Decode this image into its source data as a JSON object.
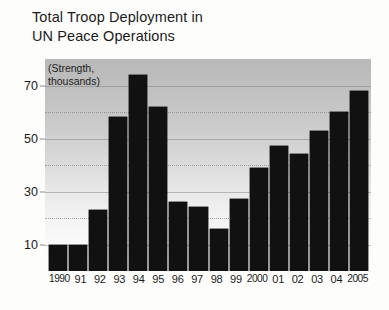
{
  "title": {
    "line1": "Total Troop Deployment in",
    "line2": "UN Peace Operations"
  },
  "axis_note": {
    "line1": "(Strength,",
    "line2": "thousands)"
  },
  "colors": {
    "bar": "#111111",
    "plot_background_top": "#b9b9b9",
    "plot_background_bottom": "#fefefe",
    "gridline": "#787878",
    "text": "#1b1b1b",
    "page_background": "#fdfdfc"
  },
  "chart_data": {
    "type": "bar",
    "title": "Total Troop Deployment in UN Peace Operations",
    "subtitle": "(Strength, thousands)",
    "xlabel": "",
    "ylabel": "Strength, thousands",
    "ylim": [
      0,
      80
    ],
    "yticks": [
      10,
      30,
      50,
      70
    ],
    "yticks_minor": [
      20,
      40,
      60
    ],
    "grid": true,
    "legend": null,
    "categories": [
      "1990",
      "91",
      "92",
      "93",
      "94",
      "95",
      "96",
      "97",
      "98",
      "99",
      "2000",
      "01",
      "02",
      "03",
      "04",
      "2005"
    ],
    "values": [
      10,
      10,
      23,
      58,
      74,
      62,
      26,
      24,
      16,
      27,
      39,
      47,
      44,
      53,
      60,
      68
    ]
  }
}
